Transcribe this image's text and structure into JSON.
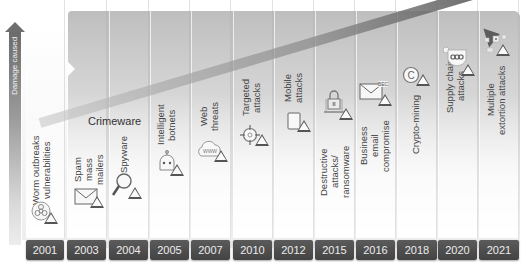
{
  "axis": {
    "label": "Damage caused",
    "direction": "up"
  },
  "group_label": "Crimeware",
  "timeline": [
    {
      "year": "2001",
      "label": "Worm outbreaks\nvulnerabilities",
      "icon": "biohazard-icon"
    },
    {
      "year": "2003",
      "label": "Spam\nmass\nmailers",
      "icon": "envelope-icon"
    },
    {
      "year": "2004",
      "label": "Spyware",
      "icon": "magnifier-icon"
    },
    {
      "year": "2005",
      "label": "Intelligent\nbotnets",
      "icon": "robot-icon"
    },
    {
      "year": "2007",
      "label": "Web\nthreats",
      "icon": "www-cloud-icon"
    },
    {
      "year": "2010",
      "label": "Targeted\nattacks",
      "icon": "crosshair-icon"
    },
    {
      "year": "2012",
      "label": "Mobile\nattacks",
      "icon": "mobile-device-icon"
    },
    {
      "year": "2015",
      "label": "Destructive\nattacks/\nransomware",
      "icon": "padlock-laptop-icon"
    },
    {
      "year": "2016",
      "label": "Business\nemail\ncompromise",
      "icon": "bec-envelope-icon",
      "icon_text": "BEC"
    },
    {
      "year": "2018",
      "label": "Crypto-mining",
      "icon": "coin-icon"
    },
    {
      "year": "2020",
      "label": "Supply chain\nattacks",
      "icon": "chain-shield-icon"
    },
    {
      "year": "2021",
      "label": "Multiple\nextortion attacks",
      "icon": "network-nodes-icon"
    }
  ],
  "colors": {
    "year_box": "#4a4a4a",
    "year_text": "#ececec",
    "panel": "#c4c4c4",
    "trend": "#7a7a7a",
    "label_text": "#444444"
  }
}
